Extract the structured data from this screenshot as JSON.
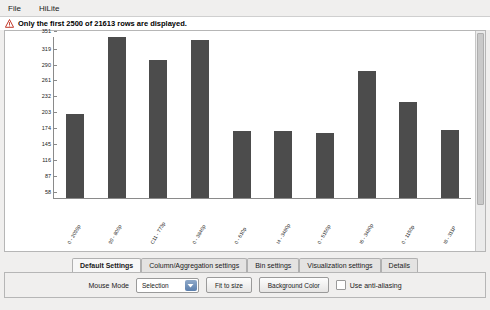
{
  "menubar": {
    "items": [
      {
        "label": "File"
      },
      {
        "label": "HiLite"
      }
    ]
  },
  "warning": {
    "icon": "warning-triangle-icon",
    "text": "Only the first 2500 of 21613 rows are displayed."
  },
  "tabs": [
    {
      "label": "Default Settings",
      "active": true
    },
    {
      "label": "Column/Aggregation settings",
      "active": false
    },
    {
      "label": "Bin settings",
      "active": false
    },
    {
      "label": "Visualization settings",
      "active": false
    },
    {
      "label": "Details",
      "active": false
    }
  ],
  "controls": {
    "mouse_mode_label": "Mouse Mode",
    "mouse_mode_value": "Selection",
    "fit_to_size_label": "Fit to size",
    "background_color_label": "Background Color",
    "anti_aliasing_label": "Use anti-aliasing",
    "anti_aliasing_checked": false
  },
  "chart_data": {
    "type": "bar",
    "title": "",
    "xlabel": "",
    "ylabel": "",
    "categories": [
      "0 - 2099p",
      "99 - 800p",
      "C11 - 773p",
      "0 - 3840p",
      "0 - 610p",
      "I4 - 3480p",
      "0 - 5150p",
      "I6 - 3480p",
      "0 - 1150p",
      "I8 - 311P"
    ],
    "values": [
      210,
      351,
      310,
      345,
      180,
      180,
      176,
      290,
      233,
      181
    ],
    "ylim": [
      58,
      351
    ],
    "yticks": [
      58,
      87,
      116,
      145,
      174,
      203,
      232,
      261,
      290,
      319,
      351
    ],
    "ytick_labels": [
      "58",
      "87",
      "116",
      "145",
      "174",
      "203",
      "232",
      "261",
      "290",
      "319",
      "351"
    ],
    "grid": false,
    "bar_color": "#4c4c4c",
    "legend": null
  }
}
